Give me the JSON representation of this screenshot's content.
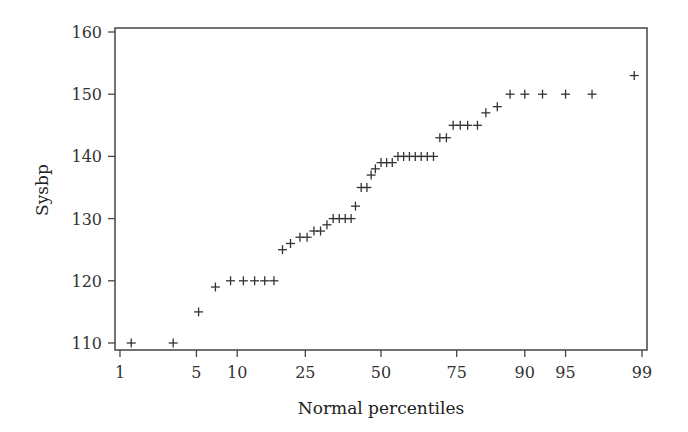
{
  "chart_data": {
    "type": "scatter",
    "title": "",
    "xlabel": "Normal percentiles",
    "ylabel": "Sysbp",
    "x_scale": "normal-probability",
    "x_ticks": [
      1,
      5,
      10,
      25,
      50,
      75,
      90,
      95,
      99
    ],
    "y_ticks": [
      110,
      120,
      130,
      140,
      150,
      160
    ],
    "ylim": [
      109,
      160.5
    ],
    "xlim": [
      0.7,
      99.3
    ],
    "grid": false,
    "legend": null,
    "marker": "+",
    "colors": {
      "marker": "#333333",
      "axis": "#444444"
    },
    "points": [
      {
        "x": 1.3,
        "y": 110
      },
      {
        "x": 3.2,
        "y": 110
      },
      {
        "x": 5.2,
        "y": 115
      },
      {
        "x": 7.0,
        "y": 119
      },
      {
        "x": 9.0,
        "y": 120
      },
      {
        "x": 11.0,
        "y": 120
      },
      {
        "x": 13.0,
        "y": 120
      },
      {
        "x": 15.0,
        "y": 120
      },
      {
        "x": 17.0,
        "y": 120
      },
      {
        "x": 19.0,
        "y": 125
      },
      {
        "x": 21.0,
        "y": 126
      },
      {
        "x": 23.5,
        "y": 127
      },
      {
        "x": 25.5,
        "y": 127
      },
      {
        "x": 27.5,
        "y": 128
      },
      {
        "x": 29.5,
        "y": 128
      },
      {
        "x": 31.5,
        "y": 129
      },
      {
        "x": 33.5,
        "y": 130
      },
      {
        "x": 35.5,
        "y": 130
      },
      {
        "x": 37.5,
        "y": 130
      },
      {
        "x": 39.5,
        "y": 130
      },
      {
        "x": 41.0,
        "y": 132
      },
      {
        "x": 43.0,
        "y": 135
      },
      {
        "x": 45.0,
        "y": 135
      },
      {
        "x": 46.5,
        "y": 137
      },
      {
        "x": 48.0,
        "y": 138
      },
      {
        "x": 50.0,
        "y": 139
      },
      {
        "x": 52.0,
        "y": 139
      },
      {
        "x": 54.0,
        "y": 139
      },
      {
        "x": 56.0,
        "y": 140
      },
      {
        "x": 58.0,
        "y": 140
      },
      {
        "x": 60.0,
        "y": 140
      },
      {
        "x": 62.0,
        "y": 140
      },
      {
        "x": 64.0,
        "y": 140
      },
      {
        "x": 66.0,
        "y": 140
      },
      {
        "x": 68.0,
        "y": 140
      },
      {
        "x": 70.0,
        "y": 143
      },
      {
        "x": 72.0,
        "y": 143
      },
      {
        "x": 74.0,
        "y": 145
      },
      {
        "x": 76.0,
        "y": 145
      },
      {
        "x": 78.0,
        "y": 145
      },
      {
        "x": 80.5,
        "y": 145
      },
      {
        "x": 82.5,
        "y": 147
      },
      {
        "x": 85.0,
        "y": 148
      },
      {
        "x": 87.5,
        "y": 150
      },
      {
        "x": 90.0,
        "y": 150
      },
      {
        "x": 92.5,
        "y": 150
      },
      {
        "x": 95.0,
        "y": 150
      },
      {
        "x": 97.0,
        "y": 150
      },
      {
        "x": 98.8,
        "y": 153
      }
    ]
  }
}
